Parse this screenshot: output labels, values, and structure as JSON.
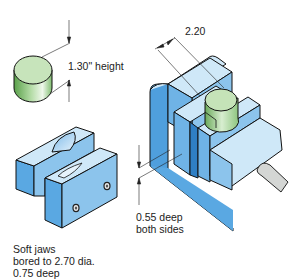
{
  "figure": {
    "annotations": {
      "blank_height": "1.30\" height",
      "width_dim": "2.20",
      "depth_note": {
        "line1": "0.55 deep",
        "line2": "both sides"
      },
      "soft_jaws_note": {
        "line1": "Soft jaws",
        "line2": "bored to 2.70 dia.",
        "line3": "0.75 deep"
      }
    },
    "parts": [
      "cylindrical-blank",
      "soft-jaws",
      "vise-with-workpiece"
    ],
    "colors": {
      "blank_green": "#9fd08f",
      "blank_top": "#c9e6bd",
      "jaw_light_blue": "#cfe8f8",
      "jaw_mid_blue": "#8cc4ec",
      "jaw_dark_blue": "#4f9fdd",
      "handle_gray": "#d4d6d4",
      "outline": "#111111"
    }
  }
}
